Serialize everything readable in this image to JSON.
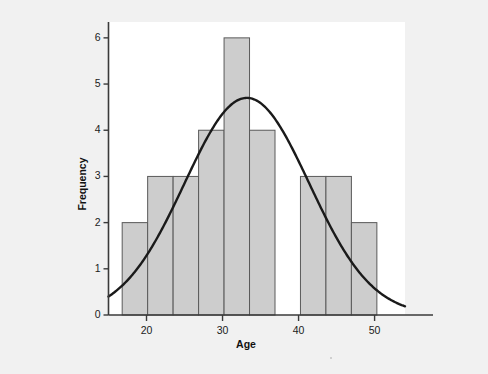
{
  "figure": {
    "background_color": "#f1f1f1",
    "plot_background_color": "#ffffff",
    "bar_fill_color": "#cdcdcd",
    "bar_border_color": "#5a5a5a",
    "curve_color": "#1a1a1a",
    "axis_color": "#3a3a3a"
  },
  "chart_data": {
    "type": "bar",
    "title": "",
    "subtitle": "",
    "xlabel": "Age",
    "ylabel": "Frequency",
    "xlim": [
      15,
      54
    ],
    "ylim": [
      0,
      6.3
    ],
    "grid": false,
    "legend": null,
    "bin_width": 3.35,
    "bin_edges": [
      16.8,
      20.15,
      23.5,
      26.85,
      30.2,
      33.55,
      36.9,
      40.25,
      43.6,
      46.95,
      50.3
    ],
    "categories": [
      "16.8-20.2",
      "20.2-23.5",
      "23.5-26.9",
      "26.9-30.2",
      "30.2-33.6",
      "33.6-36.9",
      "36.9-40.3",
      "40.3-43.6",
      "43.6-47.0",
      "47.0-50.3"
    ],
    "values": [
      2,
      3,
      3,
      4,
      6,
      4,
      0,
      3,
      3,
      2
    ],
    "x_ticks": [
      20,
      30,
      40,
      50
    ],
    "x_tick_labels": [
      "20",
      "30",
      "40",
      "50"
    ],
    "y_ticks": [
      0,
      1,
      2,
      3,
      4,
      5,
      6
    ],
    "y_tick_labels": [
      "0",
      "1",
      "2",
      "3",
      "4",
      "5",
      "6"
    ],
    "overlay": {
      "type": "normal-curve",
      "name": "Normal distribution curve",
      "mean": 33.2,
      "std_dev": 8.2,
      "peak_value": 4.7,
      "peak_x": 33.2,
      "start_value": 0.5,
      "end_value": 0.25
    }
  }
}
